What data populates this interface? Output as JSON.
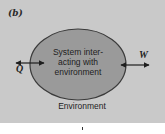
{
  "figure": {
    "panel_label": "(b)",
    "system": {
      "line1": "System inter-",
      "line2": "acting with",
      "line3": "environment"
    },
    "environment_label": "Environment",
    "heat_label": "Q",
    "work_label": "W"
  },
  "colors": {
    "panel_background": "#c9c9c9",
    "system_fill": "#9a9a9a",
    "outline": "#3a3a3a",
    "arrow": "#1e1e1e",
    "page_background": "#ffffff"
  }
}
